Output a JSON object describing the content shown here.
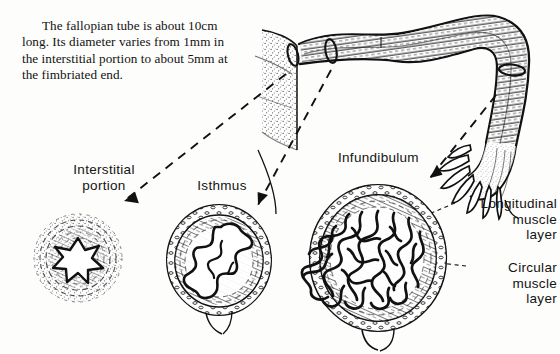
{
  "figure": {
    "background_color": "#fdfdfc",
    "ink_color": "#111111",
    "caption": "The fallopian tube is about 10cm long. Its diameter varies from 1mm in the interstitial portion to about 5mm at the fimbriated end.",
    "caption_facts": {
      "length": "10cm",
      "min_diameter": "1mm",
      "min_diameter_site": "interstitial portion",
      "max_diameter": "5mm",
      "max_diameter_site": "fimbriated end"
    }
  },
  "labels": {
    "interstitial": "Interstitial\nportion",
    "isthmus": "Isthmus",
    "infundibulum": "Infundibulum",
    "longitudinal_muscle": "Longitudinal\nmuscle\nlayer",
    "circular_muscle": "Circular\nmuscle\nlayer"
  },
  "sections": [
    {
      "name": "interstitial-cross-section",
      "label": "Interstitial portion",
      "lumen": "star-shaped narrow lumen",
      "relative_size": "smallest",
      "center": [
        78,
        258
      ],
      "radius": 44
    },
    {
      "name": "isthmus-cross-section",
      "label": "Isthmus",
      "lumen": "branched folded mucosa",
      "relative_size": "medium",
      "center": [
        219,
        260
      ],
      "radius": 52
    },
    {
      "name": "infundibulum-cross-section",
      "label": "Infundibulum",
      "lumen": "dense labyrinthine mucosal folds",
      "relative_size": "largest",
      "center": [
        378,
        258
      ],
      "radius": 68
    }
  ],
  "tube_diagram": {
    "name": "fallopian-tube-drawing",
    "parts": [
      "uterine wall",
      "interstitial portion",
      "isthmus",
      "ampulla",
      "infundibulum",
      "fimbriae"
    ],
    "marker_rings": 3
  },
  "pointers": [
    {
      "name": "pointer-interstitial",
      "from": "tube interstitial marker",
      "to": "interstitial cross section",
      "style": "dashed-arrow"
    },
    {
      "name": "pointer-isthmus",
      "from": "tube isthmus marker",
      "to": "isthmus cross section",
      "style": "dashed-arrow"
    },
    {
      "name": "pointer-infundibulum",
      "from": "tube fimbriated end",
      "to": "infundibulum cross section",
      "style": "dashed-arrow"
    },
    {
      "name": "leader-longitudinal",
      "from": "longitudinal muscle label",
      "to": "outer muscle layer",
      "style": "dashed-leader"
    },
    {
      "name": "leader-circular",
      "from": "circular muscle label",
      "to": "inner muscle layer",
      "style": "dashed-leader"
    }
  ]
}
